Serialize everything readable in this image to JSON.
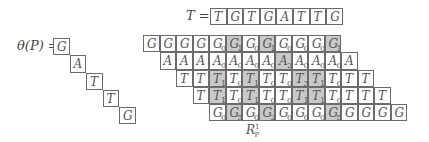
{
  "theta_label": "θ(P) =",
  "theta_P": [
    "G",
    "A",
    "T",
    "T",
    "G"
  ],
  "T_label": "T =",
  "T": [
    "T",
    "G",
    "T",
    "G",
    "A",
    "T",
    "T",
    "G"
  ],
  "rows": [
    {
      "start_col": 0,
      "cells": [
        {
          "c": "G",
          "s": ""
        },
        {
          "c": "G",
          "s": ""
        },
        {
          "c": "G",
          "s": ""
        },
        {
          "c": "G",
          "s": ""
        },
        {
          "c": "G",
          "s": "0"
        },
        {
          "c": "G",
          "s": "1",
          "shaded": true
        },
        {
          "c": "G",
          "s": "0"
        },
        {
          "c": "G",
          "s": "1",
          "shaded": true
        },
        {
          "c": "G",
          "s": "0"
        },
        {
          "c": "G",
          "s": "0"
        },
        {
          "c": "G",
          "s": "0"
        },
        {
          "c": "G",
          "s": "1",
          "shaded": true
        }
      ]
    },
    {
      "start_col": 1,
      "cells": [
        {
          "c": "A",
          "s": ""
        },
        {
          "c": "A",
          "s": ""
        },
        {
          "c": "A",
          "s": ""
        },
        {
          "c": "A",
          "s": "0"
        },
        {
          "c": "A",
          "s": "0"
        },
        {
          "c": "A",
          "s": "0"
        },
        {
          "c": "A",
          "s": "0"
        },
        {
          "c": "A",
          "s": "2",
          "shaded": true
        },
        {
          "c": "A",
          "s": "0"
        },
        {
          "c": "A",
          "s": "0"
        },
        {
          "c": "A",
          "s": "0"
        },
        {
          "c": "A",
          "s": ""
        }
      ]
    },
    {
      "start_col": 2,
      "cells": [
        {
          "c": "T",
          "s": ""
        },
        {
          "c": "T",
          "s": ""
        },
        {
          "c": "T",
          "s": "1",
          "shaded": true
        },
        {
          "c": "T",
          "s": "0"
        },
        {
          "c": "T",
          "s": "1",
          "shaded": true
        },
        {
          "c": "T",
          "s": "0"
        },
        {
          "c": "T",
          "s": "0"
        },
        {
          "c": "T",
          "s": "3",
          "shaded": true
        },
        {
          "c": "T",
          "s": "1",
          "shaded": true
        },
        {
          "c": "T",
          "s": "0"
        },
        {
          "c": "T",
          "s": ""
        },
        {
          "c": "T",
          "s": ""
        }
      ]
    },
    {
      "start_col": 3,
      "cells": [
        {
          "c": "T",
          "s": ""
        },
        {
          "c": "T",
          "s": "1",
          "shaded": true
        },
        {
          "c": "T",
          "s": "0"
        },
        {
          "c": "T",
          "s": "1",
          "shaded": true
        },
        {
          "c": "T",
          "s": "0"
        },
        {
          "c": "T",
          "s": "0"
        },
        {
          "c": "T",
          "s": "1",
          "shaded": true
        },
        {
          "c": "T",
          "s": "1",
          "shaded": true
        },
        {
          "c": "T",
          "s": "0"
        },
        {
          "c": "T",
          "s": ""
        },
        {
          "c": "T",
          "s": ""
        },
        {
          "c": "T",
          "s": ""
        }
      ]
    },
    {
      "start_col": 4,
      "cells": [
        {
          "c": "G",
          "s": "0"
        },
        {
          "c": "G",
          "s": "5",
          "shaded": true
        },
        {
          "c": "G",
          "s": "0"
        },
        {
          "c": "G",
          "s": "2",
          "shaded": true
        },
        {
          "c": "G",
          "s": "0"
        },
        {
          "c": "G",
          "s": "0"
        },
        {
          "c": "G",
          "s": "0"
        },
        {
          "c": "G",
          "s": "5",
          "shaded": true
        },
        {
          "c": "G",
          "s": ""
        },
        {
          "c": "G",
          "s": ""
        },
        {
          "c": "G",
          "s": ""
        },
        {
          "c": "G",
          "s": ""
        }
      ]
    }
  ],
  "R_label": {
    "base": "R",
    "sup": "1",
    "sub": "P"
  }
}
